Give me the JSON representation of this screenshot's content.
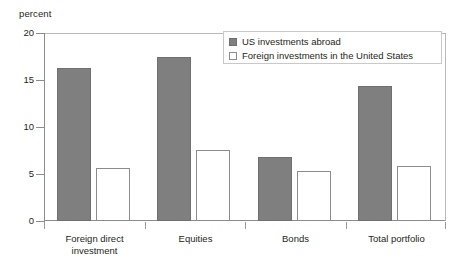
{
  "chart_data": {
    "type": "bar",
    "title": "",
    "subtitle": "",
    "xlabel": "",
    "ylabel": "percent",
    "ylim": [
      0,
      20
    ],
    "yticks": [
      0,
      5,
      10,
      15,
      20
    ],
    "ytick_labels": [
      "0",
      "5",
      "10",
      "15",
      "20"
    ],
    "grid": false,
    "legend_position": "top-right",
    "categories": [
      "Foreign direct investment",
      "Equities",
      "Bonds",
      "Total portfolio"
    ],
    "category_lines": [
      [
        "Foreign direct",
        "investment"
      ],
      [
        "Equities"
      ],
      [
        "Bonds"
      ],
      [
        "Total portfolio"
      ]
    ],
    "series": [
      {
        "name": "US investments abroad",
        "color": "#7f7f7f",
        "values": [
          16.3,
          17.4,
          6.8,
          14.4
        ]
      },
      {
        "name": "Foreign investments in the United States",
        "color": "#ffffff",
        "values": [
          5.6,
          7.6,
          5.3,
          5.9
        ]
      }
    ]
  },
  "legend": {
    "entries": [
      {
        "label": "US investments abroad",
        "swatch": "filled-gray-square-icon"
      },
      {
        "label": "Foreign investments in the United States",
        "swatch": "outlined-white-square-icon"
      }
    ]
  }
}
